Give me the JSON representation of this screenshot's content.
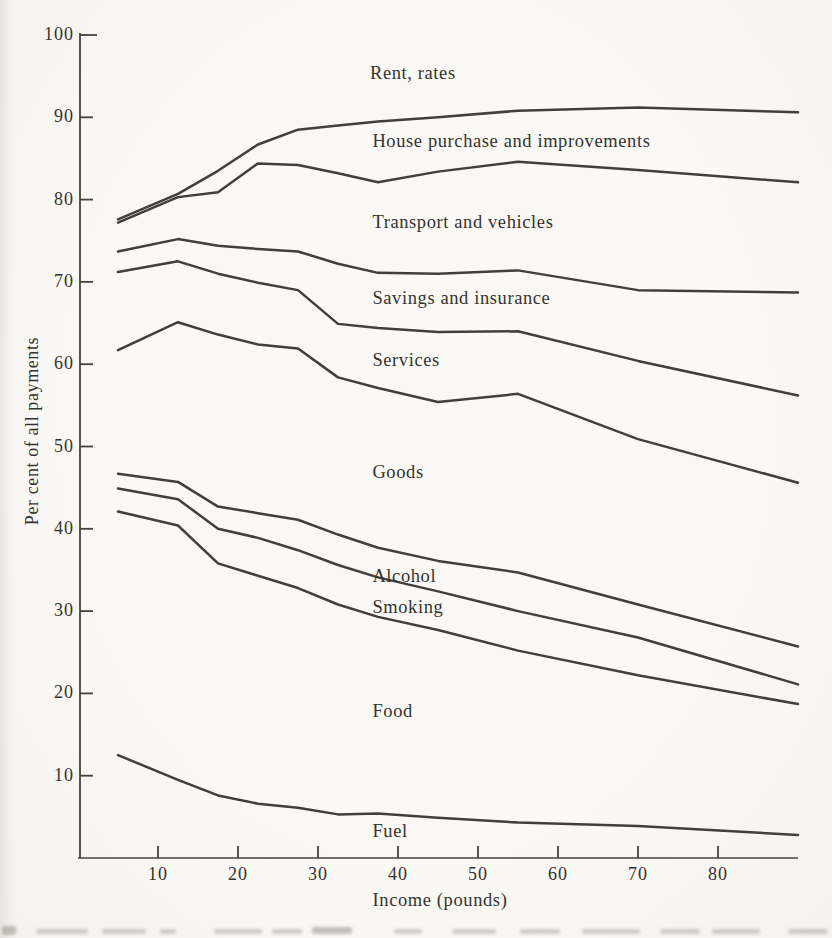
{
  "figure": {
    "background_color": "#faf9f6",
    "ink_color": "#33302c",
    "axis_color": "#45423d"
  },
  "chart_data": {
    "type": "line",
    "title": "",
    "xlabel": "Income (pounds)",
    "ylabel": "Per cent of all payments",
    "xlim": [
      0,
      90
    ],
    "ylim": [
      0,
      100
    ],
    "grid": false,
    "legend_position": "inline band labels between lines",
    "note": "Each line is the cumulative upper boundary of the named expenditure band; bands stack from Fuel at the bottom to Rent, rates at the top.",
    "x": [
      5,
      12.5,
      17.5,
      22.5,
      27.5,
      32.5,
      37.5,
      45,
      55,
      70,
      90
    ],
    "x_ticks": [
      10,
      20,
      30,
      40,
      50,
      60,
      70,
      80
    ],
    "y_ticks": [
      10,
      20,
      30,
      40,
      50,
      60,
      70,
      80,
      90,
      100
    ],
    "series": [
      {
        "name": "house-purchase-upper-boundary",
        "band_below": "House purchase and improvements",
        "values": [
          77.6,
          80.7,
          83.5,
          86.7,
          88.5,
          89.0,
          89.5,
          90.0,
          90.8,
          91.2,
          90.6
        ]
      },
      {
        "name": "transport-upper-boundary",
        "band_below": "Transport and vehicles",
        "values": [
          77.2,
          80.3,
          80.9,
          84.4,
          84.2,
          83.2,
          82.1,
          83.4,
          84.6,
          83.6,
          82.1
        ]
      },
      {
        "name": "savings-upper-boundary",
        "band_below": "Savings and insurance",
        "values": [
          73.7,
          75.2,
          74.4,
          74.0,
          73.7,
          72.2,
          71.1,
          71.0,
          71.4,
          69.0,
          68.7
        ]
      },
      {
        "name": "services-upper-boundary",
        "band_below": "Services",
        "values": [
          71.2,
          72.5,
          71.0,
          69.9,
          69.0,
          64.9,
          64.4,
          63.9,
          64.0,
          60.4,
          56.2
        ]
      },
      {
        "name": "goods-upper-boundary",
        "band_below": "Goods",
        "values": [
          61.7,
          65.1,
          63.6,
          62.4,
          61.9,
          58.4,
          57.1,
          55.4,
          56.4,
          50.9,
          45.6
        ]
      },
      {
        "name": "alcohol-upper-boundary",
        "band_below": "Alcohol",
        "values": [
          46.7,
          45.7,
          42.7,
          41.9,
          41.1,
          39.3,
          37.7,
          36.1,
          34.7,
          30.8,
          25.7
        ]
      },
      {
        "name": "smoking-upper-boundary",
        "band_below": "Smoking",
        "values": [
          44.9,
          43.6,
          40.0,
          38.9,
          37.4,
          35.6,
          34.1,
          32.4,
          30.0,
          26.8,
          21.1
        ]
      },
      {
        "name": "food-upper-boundary",
        "band_below": "Food",
        "values": [
          42.1,
          40.4,
          35.8,
          34.3,
          32.8,
          30.8,
          29.3,
          27.7,
          25.2,
          22.2,
          18.7
        ]
      },
      {
        "name": "fuel-upper-boundary",
        "band_below": "Fuel",
        "values": [
          12.5,
          9.5,
          7.6,
          6.6,
          6.1,
          5.3,
          5.4,
          4.9,
          4.3,
          3.9,
          2.8
        ]
      }
    ],
    "annotations": [
      {
        "label": "Rent, rates",
        "x": 36.5,
        "y": 95.1
      },
      {
        "label": "House purchase and improvements",
        "x": 36.8,
        "y": 86.9
      },
      {
        "label": "Transport and vehicles",
        "x": 36.8,
        "y": 77.0
      },
      {
        "label": "Savings and insurance",
        "x": 36.8,
        "y": 67.8
      },
      {
        "label": "Services",
        "x": 36.8,
        "y": 60.3
      },
      {
        "label": "Goods",
        "x": 36.8,
        "y": 46.7
      },
      {
        "label": "Alcohol",
        "x": 36.8,
        "y": 34.0
      },
      {
        "label": "Smoking",
        "x": 36.8,
        "y": 30.3
      },
      {
        "label": "Food",
        "x": 36.8,
        "y": 17.6
      },
      {
        "label": "Fuel",
        "x": 36.8,
        "y": 3.0
      }
    ]
  }
}
